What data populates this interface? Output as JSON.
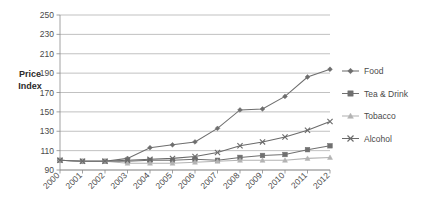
{
  "chart_data": {
    "type": "line",
    "title": "",
    "xlabel": "",
    "ylabel": "Price Index",
    "ylim": [
      90,
      250
    ],
    "ytick_step": 20,
    "yticks": [
      90,
      110,
      130,
      150,
      170,
      190,
      210,
      230,
      250
    ],
    "grid": "horizontal",
    "legend_position": "right",
    "categories": [
      "2000",
      "2001",
      "2002",
      "2003",
      "2004",
      "2005",
      "2006",
      "2007",
      "2008",
      "2009",
      "2010",
      "2011",
      "2012"
    ],
    "x": [
      2000,
      2001,
      2002,
      2003,
      2004,
      2005,
      2006,
      2007,
      2008,
      2009,
      2010,
      2011,
      2012
    ],
    "series": [
      {
        "name": "Food",
        "marker": "diamond",
        "color": "#6e6e6e",
        "values": [
          100,
          99,
          99,
          102,
          113,
          116,
          119,
          133,
          152,
          153,
          166,
          186,
          194
        ]
      },
      {
        "name": "Tea & Drink",
        "marker": "square",
        "color": "#707070",
        "values": [
          100,
          99,
          99,
          99,
          100,
          100,
          101,
          100,
          103,
          105,
          106,
          111,
          115
        ]
      },
      {
        "name": "Tobacco",
        "marker": "triangle",
        "color": "#b3b3b3",
        "values": [
          100,
          99,
          99,
          97,
          97,
          97,
          98,
          99,
          100,
          100,
          100,
          102,
          103
        ]
      },
      {
        "name": "Alcohol",
        "marker": "x",
        "color": "#6a6a6a",
        "values": [
          100,
          99,
          99,
          100,
          101,
          102,
          104,
          108,
          115,
          119,
          124,
          131,
          140
        ]
      }
    ]
  },
  "axis": {
    "y_title_line1": "Price",
    "y_title_line2": "Index"
  },
  "colors": {
    "gridline": "#a6a6a6",
    "axis": "#8c8c8c",
    "text": "#4a4a4a",
    "background": "#ffffff"
  }
}
